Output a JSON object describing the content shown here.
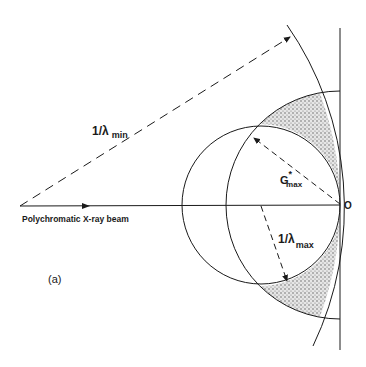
{
  "figure": {
    "panel_label": "(a)",
    "beam_label": "Polychromatic X-ray beam",
    "origin_label": "O",
    "lambda_min_label": {
      "main": "1/λ",
      "sub": "min"
    },
    "lambda_max_label": {
      "main": "1/λ",
      "sub": "max"
    },
    "gmax_label": {
      "main": "G",
      "sup": "*",
      "sub": "max"
    }
  },
  "colors": {
    "line": "#1a1a1a",
    "shaded_region": "#b8b8b8",
    "background": "#ffffff"
  }
}
